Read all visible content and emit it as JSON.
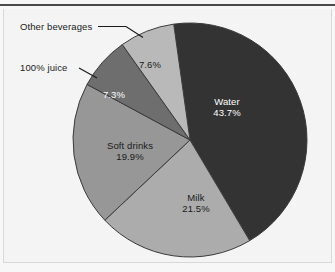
{
  "chart_data": {
    "type": "pie",
    "title": "",
    "subtitle": "",
    "xlabel": "",
    "ylabel": "",
    "legend_position": "none",
    "grid": false,
    "value_unit": "%",
    "start_angle_deg": -8,
    "direction": "clockwise",
    "categories": [
      "Water",
      "Milk",
      "Soft drinks",
      "100% juice",
      "Other beverages"
    ],
    "values": [
      43.7,
      21.5,
      19.9,
      7.3,
      7.6
    ],
    "slices": [
      {
        "name": "Water",
        "value": 43.7,
        "value_label": "43.7%",
        "color": "#333333",
        "label_style": "inside",
        "label_color": "#ffffff"
      },
      {
        "name": "Milk",
        "value": 21.5,
        "value_label": "21.5%",
        "color": "#acacac",
        "label_style": "inside",
        "label_color": "#1a1a1a"
      },
      {
        "name": "Soft drinks",
        "value": 19.9,
        "value_label": "19.9%",
        "color": "#979797",
        "label_style": "inside",
        "label_color": "#1a1a1a"
      },
      {
        "name": "100% juice",
        "value": 7.3,
        "value_label": "7.3%",
        "color": "#6e6e6e",
        "label_style": "callout",
        "label_color": "#ffffff"
      },
      {
        "name": "Other beverages",
        "value": 7.6,
        "value_label": "7.6%",
        "color": "#b9b9b9",
        "label_style": "callout",
        "label_color": "#1a1a1a"
      }
    ]
  },
  "figure": {
    "background_color": "#f4f4f4",
    "rule_color": "#4a4a4a",
    "slice_edge_color": "#3a3a3a"
  },
  "labels": {
    "water_name": "Water",
    "water_value": "43.7%",
    "milk_name": "Milk",
    "milk_value": "21.5%",
    "soft_drinks_name": "Soft drinks",
    "soft_drinks_value": "19.9%",
    "juice_value": "7.3%",
    "other_value": "7.6%",
    "juice_callout": "100% juice",
    "other_callout": "Other beverages"
  }
}
